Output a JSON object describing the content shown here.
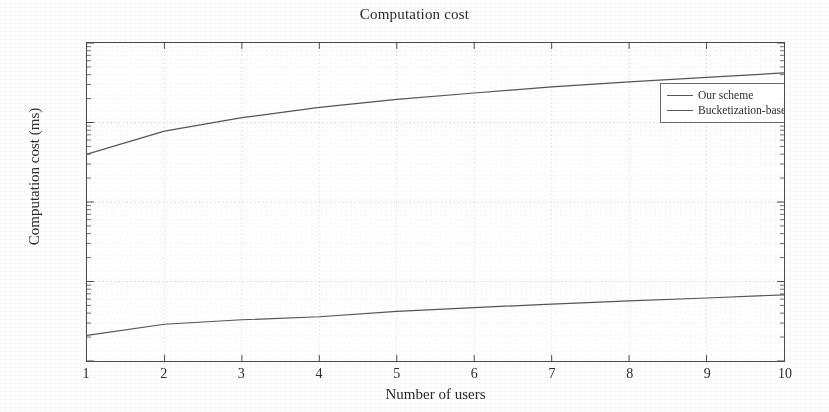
{
  "chart_data": {
    "type": "line",
    "title": "Computation cost",
    "xlabel": "Number of users",
    "ylabel": "Computation cost (ms)",
    "xlim": [
      1,
      10
    ],
    "ylim": [
      10,
      100000
    ],
    "yscale": "log",
    "xscale": "linear",
    "grid": true,
    "legend_position": "top-right",
    "x": [
      1,
      2,
      3,
      4,
      5,
      6,
      7,
      8,
      9,
      10
    ],
    "xticklabels": [
      "1",
      "2",
      "3",
      "4",
      "5",
      "6",
      "7",
      "8",
      "9",
      "10"
    ],
    "yticklabels": [
      "10",
      "10",
      "10",
      "10",
      "10"
    ],
    "yticks": [
      10,
      100,
      1000,
      10000,
      100000
    ],
    "yexponents": [
      "1",
      "2",
      "3",
      "4",
      "5"
    ],
    "series": [
      {
        "name": "Our scheme",
        "color": "#555555",
        "values": [
          21,
          29,
          33,
          36,
          42,
          47,
          52,
          57,
          62,
          68
        ]
      },
      {
        "name": "Bucketization-based scheme",
        "color": "#555555",
        "values": [
          4000,
          7800,
          11500,
          15500,
          19500,
          23500,
          28000,
          32500,
          37000,
          42000
        ]
      }
    ]
  },
  "legend": {
    "entries": [
      {
        "label": "Our scheme"
      },
      {
        "label": "Bucketization-based scheme"
      }
    ]
  }
}
